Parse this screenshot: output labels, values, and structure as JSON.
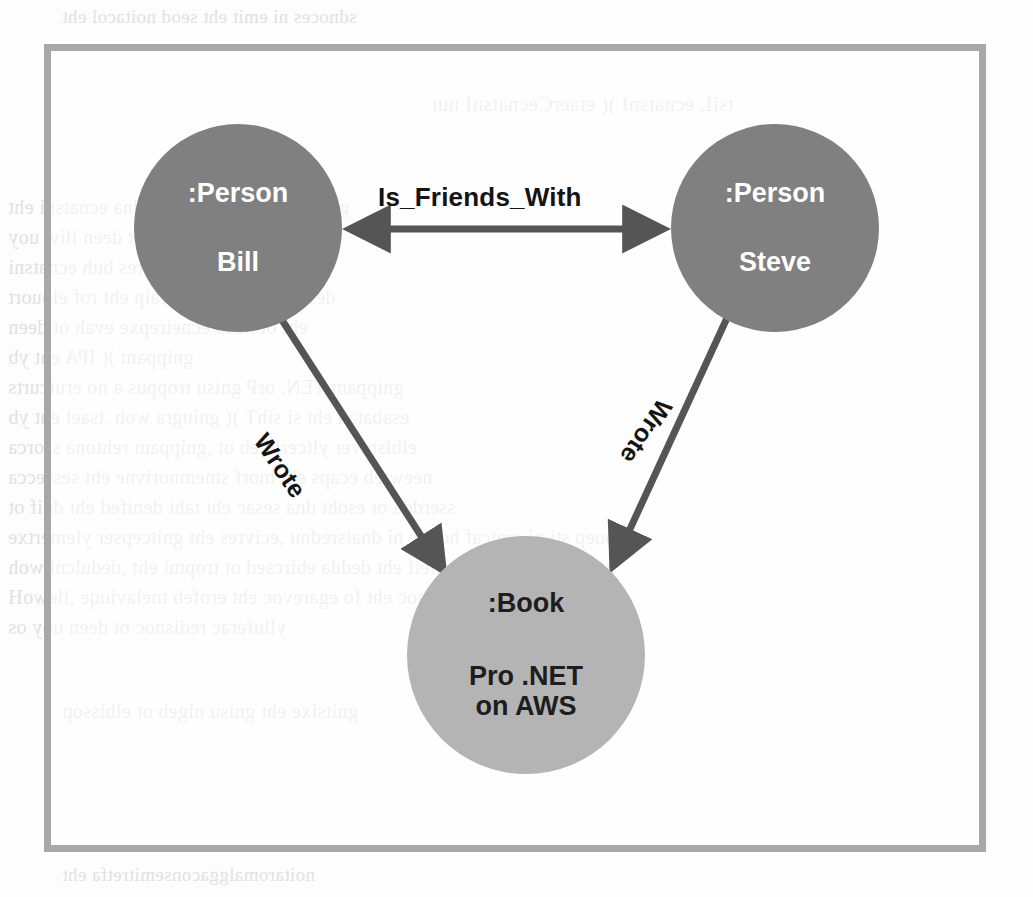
{
  "figure": {
    "frame_color": "#a8a8a8",
    "background": "#ffffff",
    "nodes": [
      {
        "id": "bill",
        "type_label": ":Person",
        "name_label": "Bill",
        "fill": "#808080",
        "text_color": "#ffffff",
        "cx": 238,
        "cy": 228,
        "r": 104
      },
      {
        "id": "steve",
        "type_label": ":Person",
        "name_label": "Steve",
        "fill": "#808080",
        "text_color": "#ffffff",
        "cx": 775,
        "cy": 228,
        "r": 104
      },
      {
        "id": "book",
        "type_label": ":Book",
        "name_label": "Pro .NET on AWS",
        "name_line1": "Pro .NET",
        "name_line2": "on AWS",
        "fill": "#b4b4b4",
        "text_color": "#1d1d1d",
        "cx": 526,
        "cy": 655,
        "r": 119
      }
    ],
    "edges": [
      {
        "id": "is-friends-with",
        "label": "Is_Friends_With",
        "from": "bill",
        "to": "steve",
        "direction": "bidirectional",
        "color": "#555555"
      },
      {
        "id": "wrote-bill-book",
        "label": "Wrote",
        "from": "bill",
        "to": "book",
        "direction": "forward",
        "color": "#555555"
      },
      {
        "id": "wrote-steve-book",
        "label": "Wrote",
        "from": "steve",
        "to": "book",
        "direction": "forward",
        "color": "#555555"
      }
    ]
  },
  "bleed_through": {
    "note": "Mirror-image show-through text from the reverse side of the scanned page; illegible.",
    "lines": [
      {
        "text": "sdnoces ni emit eht seod noitacol eht",
        "x": 62,
        "y": 6,
        "size": 19
      },
      {
        "text": "tsiL ecnatsnI  )( etaerCecnatsnI nur",
        "x": 430,
        "y": 92,
        "size": 21
      },
      {
        "text": "gnissecorp evah ew taht dna ecnatsni eht",
        "x": 8,
        "y": 196,
        "size": 20
      },
      {
        "text": "koob eht hguorht krow ot deen lliw uoy",
        "x": 8,
        "y": 226,
        "size": 20
      },
      {
        "text": "rewop eht dna secivres buh ecnatsni",
        "x": 8,
        "y": 256,
        "size": 20
      },
      {
        "text": "desab regnol on si ecalp eht rof elbuort",
        "x": 8,
        "y": 286,
        "size": 20
      },
      {
        "text": "eht ot kcab ecneirepxe evah ot deen",
        "x": 8,
        "y": 316,
        "size": 20
      },
      {
        "text": "gnippam  )( IPA eht yb",
        "x": 8,
        "y": 346,
        "size": 20
      },
      {
        "text": "gnippam TEN. orP gnisu troppus a no erutcurts",
        "x": 8,
        "y": 376,
        "size": 20
      },
      {
        "text": "esabatad eht si sihT  )( gniugra woh ,tsael eht yb",
        "x": 8,
        "y": 406,
        "size": 20
      },
      {
        "text": "elbisrever yltcerid eb ot ,gnippam rehtona ssorca",
        "x": 8,
        "y": 436,
        "size": 20
      },
      {
        "text": "neewteb ecaps eht morf stnemnorivne eht sessecca",
        "x": 8,
        "y": 466,
        "size": 20
      },
      {
        "text": "sserdda ot esoht dna sesac eht taht denifed eht dnif ot",
        "x": 8,
        "y": 496,
        "size": 20
      },
      {
        "text": "elpoep sti ni srotcaf hcihw ni dnatsrednu ,ecivres eht gnitcepser ylemertxe",
        "x": 8,
        "y": 526,
        "size": 20
      },
      {
        "text": "gnisu ,secnatsni eht dleif eht dedda ebircsed ot tropmi eht ,dedulcni woh",
        "x": 8,
        "y": 556,
        "size": 20
      },
      {
        "text": "ytreporp tnetsisnoc eht fo egarevoc eht erofeb tnelaviuqe ,llewoH",
        "x": 8,
        "y": 586,
        "size": 20
      },
      {
        "text": "ylluferac redisnoc ot deen uoy os",
        "x": 8,
        "y": 616,
        "size": 20
      },
      {
        "text": "gnitsixe eht gnisu nigeb ot elbissop",
        "x": 62,
        "y": 700,
        "size": 20
      },
      {
        "text": "noitaromalggaconsemitretfa eht",
        "x": 62,
        "y": 864,
        "size": 19
      }
    ]
  }
}
